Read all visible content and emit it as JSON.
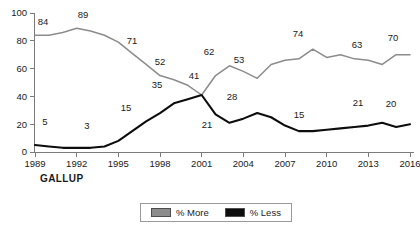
{
  "brand": "GALLUP",
  "legend": {
    "entries": [
      {
        "label": "% More",
        "color": "#8c8c8c"
      },
      {
        "label": "% Less",
        "color": "#0d0d0d"
      }
    ]
  },
  "axes": {
    "y_ticks": [
      "0",
      "20",
      "40",
      "60",
      "80",
      "100"
    ],
    "x_ticks": [
      "1989",
      "1992",
      "1995",
      "1998",
      "2001",
      "2004",
      "2007",
      "2010",
      "2013",
      "2016"
    ]
  },
  "chart_data": {
    "type": "line",
    "title": "",
    "xlabel": "",
    "ylabel": "",
    "xlim": [
      1989,
      2016
    ],
    "ylim": [
      0,
      100
    ],
    "grid": false,
    "legend_position": "bottom",
    "x_tick_values": [
      1989,
      1992,
      1995,
      1998,
      2001,
      2004,
      2007,
      2010,
      2013,
      2016
    ],
    "y_tick_values": [
      0,
      20,
      40,
      60,
      80,
      100
    ],
    "series": [
      {
        "name": "% More",
        "color": "#8c8c8c",
        "points": [
          {
            "x": 1989,
            "y": 84,
            "label": "84"
          },
          {
            "x": 1990,
            "y": 84,
            "label": ""
          },
          {
            "x": 1991,
            "y": 86,
            "label": ""
          },
          {
            "x": 1992,
            "y": 89,
            "label": "89"
          },
          {
            "x": 1993,
            "y": 87,
            "label": ""
          },
          {
            "x": 1994,
            "y": 84,
            "label": ""
          },
          {
            "x": 1995,
            "y": 79,
            "label": ""
          },
          {
            "x": 1996,
            "y": 71,
            "label": "71"
          },
          {
            "x": 1997,
            "y": 63,
            "label": ""
          },
          {
            "x": 1998,
            "y": 55,
            "label": ""
          },
          {
            "x": 1999,
            "y": 52,
            "label": "52"
          },
          {
            "x": 2000,
            "y": 48,
            "label": ""
          },
          {
            "x": 2001,
            "y": 41,
            "label": "41"
          },
          {
            "x": 2002,
            "y": 55,
            "label": ""
          },
          {
            "x": 2003,
            "y": 62,
            "label": "62"
          },
          {
            "x": 2004,
            "y": 58,
            "label": ""
          },
          {
            "x": 2005,
            "y": 53,
            "label": "53"
          },
          {
            "x": 2006,
            "y": 63,
            "label": ""
          },
          {
            "x": 2007,
            "y": 66,
            "label": ""
          },
          {
            "x": 2008,
            "y": 67,
            "label": ""
          },
          {
            "x": 2009,
            "y": 74,
            "label": "74"
          },
          {
            "x": 2010,
            "y": 68,
            "label": ""
          },
          {
            "x": 2011,
            "y": 70,
            "label": ""
          },
          {
            "x": 2012,
            "y": 67,
            "label": ""
          },
          {
            "x": 2013,
            "y": 66,
            "label": ""
          },
          {
            "x": 2014,
            "y": 63,
            "label": "63"
          },
          {
            "x": 2015,
            "y": 70,
            "label": ""
          },
          {
            "x": 2016,
            "y": 70,
            "label": "70"
          }
        ]
      },
      {
        "name": "% Less",
        "color": "#0d0d0d",
        "points": [
          {
            "x": 1989,
            "y": 5,
            "label": "5"
          },
          {
            "x": 1990,
            "y": 4,
            "label": ""
          },
          {
            "x": 1991,
            "y": 3,
            "label": ""
          },
          {
            "x": 1992,
            "y": 3,
            "label": "3"
          },
          {
            "x": 1993,
            "y": 3,
            "label": ""
          },
          {
            "x": 1994,
            "y": 4,
            "label": ""
          },
          {
            "x": 1995,
            "y": 8,
            "label": ""
          },
          {
            "x": 1996,
            "y": 15,
            "label": "15"
          },
          {
            "x": 1997,
            "y": 22,
            "label": ""
          },
          {
            "x": 1998,
            "y": 28,
            "label": ""
          },
          {
            "x": 1999,
            "y": 35,
            "label": "35"
          },
          {
            "x": 2000,
            "y": 38,
            "label": ""
          },
          {
            "x": 2001,
            "y": 41,
            "label": "41"
          },
          {
            "x": 2002,
            "y": 27,
            "label": ""
          },
          {
            "x": 2003,
            "y": 21,
            "label": "21"
          },
          {
            "x": 2004,
            "y": 24,
            "label": ""
          },
          {
            "x": 2005,
            "y": 28,
            "label": "28"
          },
          {
            "x": 2006,
            "y": 25,
            "label": ""
          },
          {
            "x": 2007,
            "y": 19,
            "label": ""
          },
          {
            "x": 2008,
            "y": 15,
            "label": "15"
          },
          {
            "x": 2009,
            "y": 15,
            "label": ""
          },
          {
            "x": 2010,
            "y": 16,
            "label": ""
          },
          {
            "x": 2011,
            "y": 17,
            "label": ""
          },
          {
            "x": 2012,
            "y": 18,
            "label": ""
          },
          {
            "x": 2013,
            "y": 19,
            "label": ""
          },
          {
            "x": 2014,
            "y": 21,
            "label": "21"
          },
          {
            "x": 2015,
            "y": 18,
            "label": ""
          },
          {
            "x": 2016,
            "y": 20,
            "label": "20"
          }
        ]
      }
    ],
    "point_labels": [
      {
        "series": "% More",
        "x": 1989,
        "value": 84,
        "text": "84",
        "px": 43,
        "py": 25
      },
      {
        "series": "% More",
        "x": 1992,
        "value": 89,
        "text": "89",
        "px": 83,
        "py": 18
      },
      {
        "series": "% More",
        "x": 1996,
        "value": 71,
        "text": "71",
        "px": 132,
        "py": 44
      },
      {
        "series": "% More",
        "x": 1999,
        "value": 52,
        "text": "52",
        "px": 160,
        "py": 65
      },
      {
        "series": "% More",
        "x": 2001,
        "value": 41,
        "text": "41",
        "px": 194,
        "py": 79
      },
      {
        "series": "% More",
        "x": 2003,
        "value": 62,
        "text": "62",
        "px": 209,
        "py": 55
      },
      {
        "series": "% More",
        "x": 2005,
        "value": 53,
        "text": "53",
        "px": 239,
        "py": 63
      },
      {
        "series": "% More",
        "x": 2009,
        "value": 74,
        "text": "74",
        "px": 298,
        "py": 37
      },
      {
        "series": "% More",
        "x": 2014,
        "value": 63,
        "text": "63",
        "px": 357,
        "py": 48
      },
      {
        "series": "% More",
        "x": 2016,
        "value": 70,
        "text": "70",
        "px": 393,
        "py": 41
      },
      {
        "series": "% Less",
        "x": 1989,
        "value": 5,
        "text": "5",
        "px": 45,
        "py": 125
      },
      {
        "series": "% Less",
        "x": 1992,
        "value": 3,
        "text": "3",
        "px": 87,
        "py": 129
      },
      {
        "series": "% Less",
        "x": 1996,
        "value": 15,
        "text": "15",
        "px": 126,
        "py": 111
      },
      {
        "series": "% Less",
        "x": 1999,
        "value": 35,
        "text": "35",
        "px": 157,
        "py": 88
      },
      {
        "series": "% Less",
        "x": 2003,
        "value": 21,
        "text": "21",
        "px": 207,
        "py": 128
      },
      {
        "series": "% Less",
        "x": 2005,
        "value": 28,
        "text": "28",
        "px": 232,
        "py": 100
      },
      {
        "series": "% Less",
        "x": 2008,
        "value": 15,
        "text": "15",
        "px": 299,
        "py": 118
      },
      {
        "series": "% Less",
        "x": 2014,
        "value": 21,
        "text": "21",
        "px": 358,
        "py": 106
      },
      {
        "series": "% Less",
        "x": 2016,
        "value": 20,
        "text": "20",
        "px": 391,
        "py": 107
      }
    ]
  }
}
